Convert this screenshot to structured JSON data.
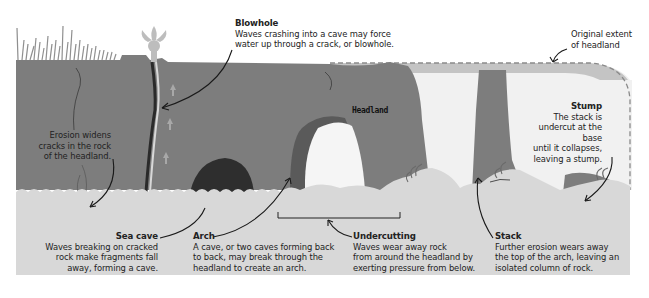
{
  "diagram": {
    "colors": {
      "rock": "#7d7d7d",
      "rock_dark": "#555555",
      "cave_dark": "#2e2e2e",
      "sea": "#d8d8d8",
      "sky": "#ffffff",
      "original_extent": "#c4c4c4",
      "spray": "#bdbdbd",
      "arrow": "#1a1a1a",
      "text": "#222222"
    },
    "headland_label": "Headland",
    "labels": {
      "blowhole": {
        "title": "Blowhole",
        "lines": [
          "Waves crashing into a cave may force",
          "water up through a crack, or blowhole."
        ]
      },
      "original_extent": {
        "lines": [
          "Original extent",
          "of headland"
        ]
      },
      "stump": {
        "title": "Stump",
        "lines": [
          "The stack is",
          "undercut at the base",
          "until it collapses,",
          "leaving a stump."
        ]
      },
      "erosion": {
        "lines": [
          "Erosion widens",
          "cracks in the rock",
          "of the headland."
        ]
      },
      "sea_cave": {
        "title": "Sea cave",
        "lines": [
          "Waves breaking on cracked",
          "rock make fragments fall",
          "away, forming a cave."
        ]
      },
      "arch": {
        "title": "Arch",
        "lines": [
          "A cave, or two caves forming back",
          "to back, may break through the",
          "headland to create an arch."
        ]
      },
      "undercutting": {
        "title": "Undercutting",
        "lines": [
          "Waves wear away rock",
          "from around the headland by",
          "exerting pressure from below."
        ]
      },
      "stack": {
        "title": "Stack",
        "lines": [
          "Further erosion wears away",
          "the top of the arch, leaving an",
          "isolated column of rock."
        ]
      }
    }
  }
}
